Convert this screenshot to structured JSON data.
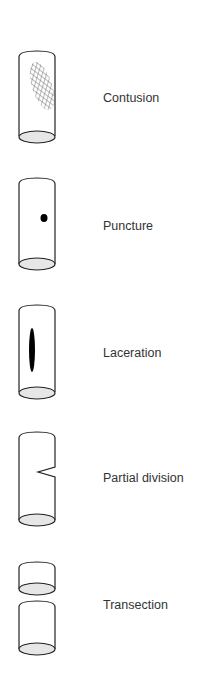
{
  "diagram": {
    "colors": {
      "stroke": "#222222",
      "ellipse_fill": "#e6e6e6",
      "mark_fill": "#000000",
      "hatch": "#555555",
      "label_text": "#333333"
    },
    "items": [
      {
        "id": "contusion",
        "label": "Contusion",
        "mark": "cross-hatched bruise area"
      },
      {
        "id": "puncture",
        "label": "Puncture",
        "mark": "small round dot"
      },
      {
        "id": "laceration",
        "label": "Laceration",
        "mark": "vertical elongated slit"
      },
      {
        "id": "partial-division",
        "label": "Partial division",
        "mark": "V-shaped notch on right wall"
      },
      {
        "id": "transection",
        "label": "Transection",
        "mark": "cylinder fully separated into two pieces"
      }
    ]
  }
}
